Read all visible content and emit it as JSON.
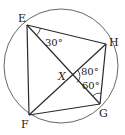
{
  "diagram": {
    "type": "inscribed-quadrilateral",
    "colors": {
      "line": "#2a2a2a",
      "circle": "#555555",
      "text": "#222222",
      "background": "#ffffff"
    },
    "circle": {
      "cx": 61,
      "cy": 66,
      "r": 57
    },
    "points": {
      "E": {
        "x": 27,
        "y": 25,
        "label": "E",
        "lx": 18,
        "ly": 22
      },
      "H": {
        "x": 106,
        "y": 44,
        "label": "H",
        "lx": 109,
        "ly": 46
      },
      "G": {
        "x": 100,
        "y": 104,
        "label": "G",
        "lx": 99,
        "ly": 117
      },
      "F": {
        "x": 29,
        "y": 115,
        "label": "F",
        "lx": 21,
        "ly": 128
      },
      "X": {
        "x": 71,
        "y": 76,
        "label": "X",
        "lx": 58,
        "ly": 80
      }
    },
    "segments": [
      [
        "E",
        "H"
      ],
      [
        "H",
        "G"
      ],
      [
        "G",
        "F"
      ],
      [
        "F",
        "E"
      ],
      [
        "E",
        "G"
      ],
      [
        "H",
        "F"
      ]
    ],
    "angles": [
      {
        "at": "E",
        "between": [
          "H",
          "G"
        ],
        "value": "30°",
        "lx": 45,
        "ly": 46
      },
      {
        "at": "X",
        "between": [
          "H",
          "G"
        ],
        "value": "80°",
        "lx": 81,
        "ly": 75
      },
      {
        "at": "G",
        "between": [
          "X",
          "H"
        ],
        "value": "60°",
        "lx": 82,
        "ly": 89
      }
    ]
  }
}
